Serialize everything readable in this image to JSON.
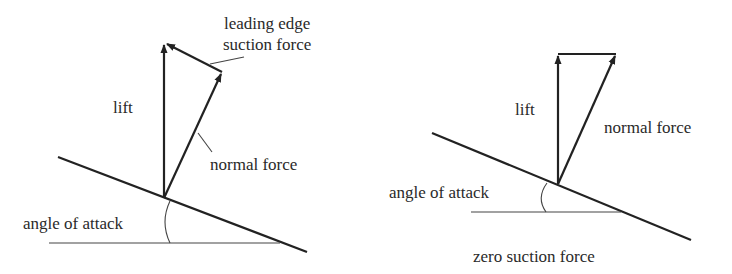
{
  "diagram": {
    "left": {
      "title": "with leading edge suction",
      "labels": {
        "suction_line1": "leading edge",
        "suction_line2": "suction force",
        "lift": "lift",
        "normal": "normal force",
        "angle": "angle of attack"
      }
    },
    "right": {
      "title": "zero suction case",
      "labels": {
        "lift": "lift",
        "normal": "normal force",
        "angle": "angle of attack",
        "caption": "zero suction force"
      }
    },
    "colors": {
      "stroke": "#222222",
      "text": "#2a2a2a",
      "background": "#ffffff"
    }
  }
}
